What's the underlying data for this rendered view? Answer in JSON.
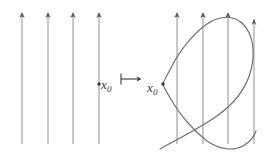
{
  "figure": {
    "title": "",
    "background_color": "#ffffff",
    "line_color": "#9b9b9b",
    "curve_color": "#6e6e6e",
    "label_color": "#3a3a3a",
    "width": 269,
    "height": 155
  },
  "left_panel": {
    "name": "source-vector-field",
    "arrow_count": 4,
    "arrow_x_positions": [
      22,
      48,
      73,
      99
    ],
    "arrow_top_y": 11,
    "arrow_bottom_y": 144,
    "point": {
      "label_text": "x",
      "label_subscript": "0",
      "x": 99,
      "y": 84
    }
  },
  "operator": {
    "name": "maps-to",
    "symbol": "↦",
    "x": 119,
    "y": 71
  },
  "right_panel": {
    "name": "target-vector-field-with-flow-curve",
    "arrow_count": 4,
    "arrow_x_positions": [
      177,
      203,
      228,
      254
    ],
    "arrow_top_y": 11,
    "arrow_bottom_y": 144,
    "point": {
      "label_text": "x",
      "label_subscript": "0",
      "x": 163,
      "y": 84
    },
    "curve": {
      "name": "integral-curve",
      "shape": "S-shaped spiral",
      "start": [
        160,
        148
      ],
      "end": [
        256,
        152
      ]
    }
  }
}
